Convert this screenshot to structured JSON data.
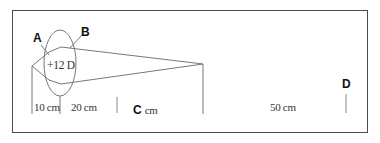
{
  "diagram": {
    "type": "optics-ray-diagram",
    "colors": {
      "line": "#777777",
      "frame": "#4a4a4a",
      "text": "#1a1a1a"
    },
    "lens": {
      "power_label": "+12 D"
    },
    "point_labels": {
      "a": "A",
      "b": "B",
      "d": "D"
    },
    "distances": {
      "first": "10 cm",
      "second": "20 cm",
      "third_letter": "C",
      "third_unit": "cm",
      "fourth": "50 cm"
    }
  }
}
